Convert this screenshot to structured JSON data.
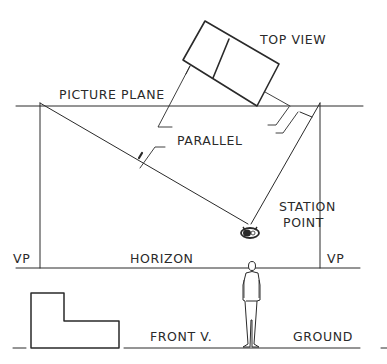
{
  "diagram": {
    "type": "two-point perspective setup",
    "colors": {
      "ink": "#2a2a2a",
      "background": "#ffffff"
    },
    "labels": {
      "top_view": "TOP VIEW",
      "picture_plane": "PICTURE PLANE",
      "parallel": "PARALLEL",
      "station_point_line1": "STATION",
      "station_point_line2": "POINT",
      "vp_left": "VP",
      "vp_right": "VP",
      "horizon": "HORIZON",
      "front_view": "FRONT V.",
      "ground": "GROUND"
    },
    "elements": [
      "picture-plane-line",
      "top-view-rotated-rectangle",
      "station-point-eye",
      "sight-lines-parallel-to-object-edges",
      "vanishing-point-projectors",
      "horizon-line",
      "ground-line",
      "front-view-l-shape",
      "standing-observer-figure"
    ]
  }
}
